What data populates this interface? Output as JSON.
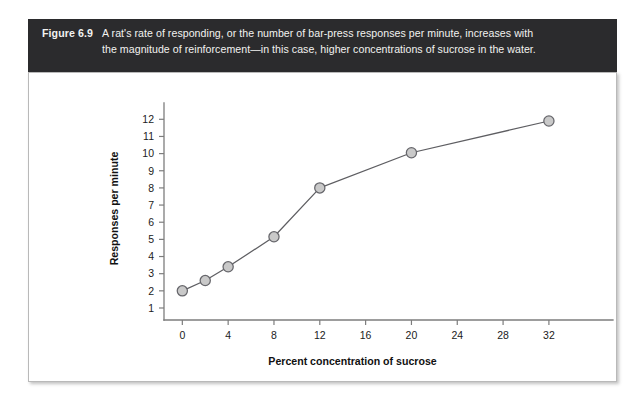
{
  "figure": {
    "label": "Figure 6.9",
    "caption_line_1": "A rat's rate of responding, or the number of bar-press responses per minute, increases with",
    "caption_line_2": "the magnitude of reinforcement—in this case, higher concentrations of sucrose in the water.",
    "banner_color": "#2b2b2d",
    "banner_text_color": "#f2f2f0"
  },
  "chart_data": {
    "type": "line",
    "title": "",
    "xlabel": "Percent concentration of sucrose",
    "ylabel": "Responses per minute",
    "x": [
      0,
      2,
      4,
      8,
      12,
      20,
      32
    ],
    "values": [
      2.0,
      2.6,
      3.4,
      5.15,
      8.0,
      10.05,
      11.9
    ],
    "xticks": [
      0,
      4,
      8,
      12,
      16,
      20,
      24,
      28,
      32
    ],
    "xtick_labels": [
      "0",
      "4",
      "8",
      "12",
      "16",
      "20",
      "24",
      "28",
      "32"
    ],
    "yticks": [
      1,
      2,
      3,
      4,
      5,
      6,
      7,
      8,
      9,
      10,
      11,
      12
    ],
    "ytick_labels": [
      "1",
      "2",
      "3",
      "4",
      "5",
      "6",
      "7",
      "8",
      "9",
      "10",
      "11",
      "12"
    ],
    "xlim": [
      -1.6,
      35.5
    ],
    "ylim": [
      0.3,
      12.6
    ],
    "grid": false,
    "legend": false,
    "marker": "circle",
    "marker_fill": "#c9c9c9",
    "marker_edge": "#66666b",
    "line_color": "#5e5e62"
  }
}
